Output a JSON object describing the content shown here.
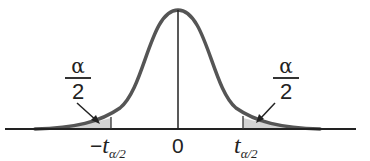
{
  "diagram": {
    "type": "t-distribution two-tailed critical region",
    "colors": {
      "curve": "#555555",
      "shade": "#d3d3d3",
      "axis": "#222222",
      "text": "#222222"
    },
    "left_tail_label": {
      "numerator": "α",
      "denominator": "2"
    },
    "right_tail_label": {
      "numerator": "α",
      "denominator": "2"
    },
    "axis_labels": {
      "left": {
        "sign": "−",
        "var": "t",
        "sub": "α/2"
      },
      "center": "0",
      "right": {
        "var": "t",
        "sub": "α/2"
      }
    }
  }
}
